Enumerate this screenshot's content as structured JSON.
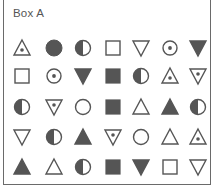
{
  "title": "Box A",
  "colors": {
    "stroke": "#555555",
    "fill": "#555555",
    "background": "#ffffff"
  },
  "layout": {
    "column_x": [
      22,
      54,
      83,
      113,
      141,
      170,
      198
    ],
    "row_y": [
      48,
      76,
      107,
      137,
      167
    ]
  },
  "rows": [
    [
      "triangle-dot",
      "circle-filled",
      "circle-half",
      "square",
      "triangle-down",
      "circle-dot",
      "triangle-down-filled"
    ],
    [
      "square",
      "circle-dot",
      "triangle-down-filled",
      "square-filled",
      "circle-half",
      "triangle-dot",
      "triangle-down-dot"
    ],
    [
      "circle-half",
      "triangle-down-dot",
      "circle",
      "square-filled",
      "triangle",
      "triangle-filled",
      "circle-half"
    ],
    [
      "triangle-down",
      "circle-half",
      "triangle-filled",
      "triangle-down-dot",
      "circle",
      "triangle",
      "triangle-dot"
    ],
    [
      "triangle-filled",
      "triangle",
      "circle-half",
      "square-filled",
      "triangle-down-filled",
      "square",
      "triangle-down"
    ]
  ]
}
